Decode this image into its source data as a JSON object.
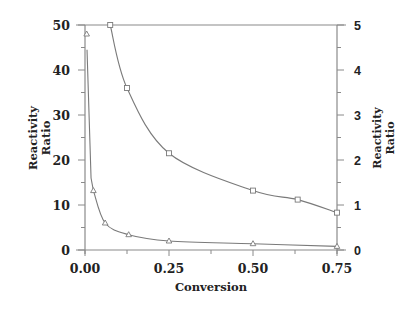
{
  "chart_data": {
    "type": "line",
    "title": "",
    "xlabel": "Conversion",
    "ylabel_left": "Reactivity Ratio",
    "ylabel_right": "Reactivity Ratio",
    "xlim": [
      0.0,
      0.75
    ],
    "ylim_left": [
      0,
      50
    ],
    "ylim_right": [
      0,
      5
    ],
    "x_ticks": [
      "0.00",
      "0.25",
      "0.50",
      "0.75"
    ],
    "y_ticks_left": [
      "0",
      "10",
      "20",
      "30",
      "40",
      "50"
    ],
    "y_ticks_right": [
      "0",
      "1",
      "2",
      "3",
      "4",
      "5"
    ],
    "grid": false,
    "legend": null,
    "series": [
      {
        "name": "triangles (left axis)",
        "marker": "triangle",
        "axis": "left",
        "x": [
          0.005,
          0.025,
          0.06,
          0.13,
          0.25,
          0.5,
          0.75
        ],
        "y": [
          48,
          13.2,
          6.0,
          3.4,
          2.0,
          1.4,
          0.8
        ]
      },
      {
        "name": "squares (right axis)",
        "marker": "square",
        "axis": "right",
        "x": [
          0.075,
          0.125,
          0.25,
          0.5,
          0.633,
          0.75
        ],
        "y": [
          5.0,
          3.6,
          2.15,
          1.32,
          1.12,
          0.83
        ]
      }
    ]
  }
}
